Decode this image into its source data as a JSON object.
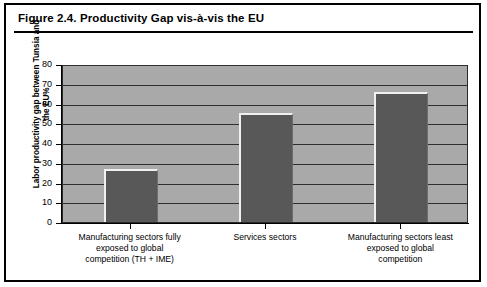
{
  "figure": {
    "title": "Figure 2.4.   Productivity Gap vis-à-vis the EU"
  },
  "chart_data": {
    "type": "bar",
    "title": "Figure 2.4.   Productivity Gap vis-à-vis the EU",
    "xlabel": "",
    "ylabel": "Labor productivity gap between Tunsia and the EU%",
    "ylim": [
      0,
      80
    ],
    "ytick_labels": [
      "80",
      "70",
      "60",
      "50",
      "40",
      "30",
      "20",
      "10",
      "0"
    ],
    "ytick_values": [
      80,
      70,
      60,
      50,
      40,
      30,
      20,
      10,
      0
    ],
    "grid": true,
    "legend": "none",
    "categories": [
      "Manufacturing sectors fully exposed to global competition (TH + IME)",
      "Services sectors",
      "Manufacturing sectors least exposed to global competition"
    ],
    "values": [
      27,
      55,
      66
    ],
    "colors": {
      "bar": "#585858",
      "plot_background": "#a9a9a9",
      "gridline": "#2f2f2f",
      "axis": "#000000",
      "page_background": "#ffffff",
      "frame_border": "#000000"
    }
  },
  "category_lines": [
    [
      "Manufacturing sectors fully",
      "exposed to global",
      "competition (TH + IME)"
    ],
    [
      "Services sectors"
    ],
    [
      "Manufacturing sectors least",
      "exposed to global",
      "competition"
    ]
  ]
}
